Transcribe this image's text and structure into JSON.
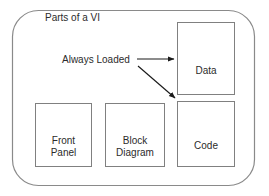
{
  "diagram": {
    "title": "Parts of a VI",
    "annotation": "Always Loaded",
    "stroke_color": "#808080",
    "arrow_color": "#1a1a1a",
    "text_color": "#2b2b2b",
    "background_color": "#ffffff",
    "container": {
      "name": "Parts of a VI",
      "shape": "rounded-rectangle",
      "x": 12,
      "y": 10,
      "width": 243,
      "height": 176,
      "corner_radius": 26
    },
    "nodes": [
      {
        "id": "data",
        "label": "Data",
        "x": 177,
        "y": 22,
        "width": 58,
        "height": 73
      },
      {
        "id": "front",
        "label": "Front\nPanel",
        "x": 35,
        "y": 103,
        "width": 57,
        "height": 64
      },
      {
        "id": "block",
        "label": "Block\nDiagram",
        "x": 105,
        "y": 103,
        "width": 60,
        "height": 64
      },
      {
        "id": "code",
        "label": "Code",
        "x": 177,
        "y": 101,
        "width": 58,
        "height": 66
      }
    ],
    "arrows": [
      {
        "id": "arrow-to-data",
        "from": "Always Loaded",
        "to": "Data",
        "style": "straight"
      },
      {
        "id": "arrow-to-code",
        "from": "Always Loaded",
        "to": "Code",
        "style": "diagonal"
      }
    ]
  }
}
